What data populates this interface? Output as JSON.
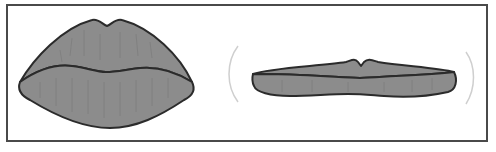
{
  "figure": {
    "panels": [
      {
        "id": "full-lips",
        "label": ""
      },
      {
        "id": "thin-lips",
        "label": ""
      }
    ],
    "colors": {
      "lip_fill": "#8c8c8c",
      "outline": "#2b2b2b",
      "frame": "#4a4a4a",
      "guide_arc": "#cfcfcf",
      "texture": "#777777"
    }
  }
}
